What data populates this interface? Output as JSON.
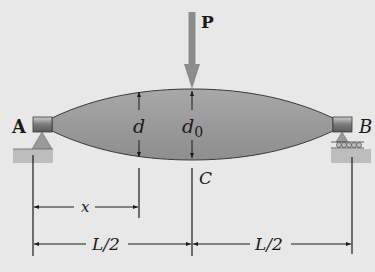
{
  "figure": {
    "type": "beam-diagram",
    "background": "#e8e8e8",
    "beam_fill": "#9a9a9a",
    "load_color": "#8c8c8c",
    "line_color": "#1a1a1a"
  },
  "labels": {
    "load": "P",
    "support_left": "A",
    "support_right": "B",
    "depth_at_x": "d",
    "depth_center_main": "d",
    "depth_center_sub": "0",
    "center_point": "C",
    "dim_x": "x",
    "dim_left_half": "L/2",
    "dim_right_half": "L/2"
  },
  "supports": {
    "left": "pin",
    "right": "roller"
  }
}
